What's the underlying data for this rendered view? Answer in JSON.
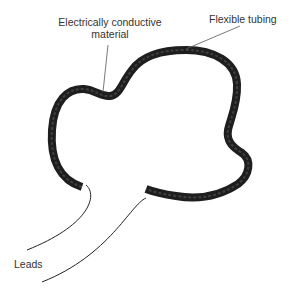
{
  "labels": {
    "conductive_line1": "Electrically conductive",
    "conductive_line2": "material",
    "tubing": "Flexible tubing",
    "leads": "Leads"
  },
  "colors": {
    "tube_outer": "#222222",
    "tube_inner": "#555555",
    "leader": "#555555"
  }
}
